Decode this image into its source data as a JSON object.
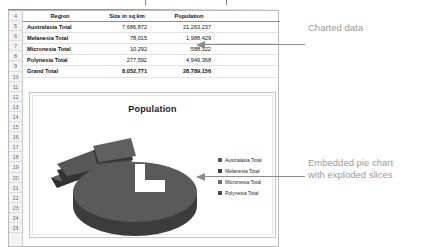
{
  "application": "spreadsheet",
  "worksheet": {
    "row_numbers": [
      4,
      5,
      6,
      7,
      8,
      9,
      10,
      11,
      12,
      13,
      14,
      15,
      16,
      17,
      18,
      19,
      20,
      21,
      22,
      23,
      24,
      25
    ],
    "table": {
      "headers": [
        "Region",
        "Size in sq km",
        "Population"
      ],
      "rows": [
        {
          "region": "Australasia Total",
          "size": "7,686,872",
          "population": "21,263,237"
        },
        {
          "region": "Melanesia Total",
          "size": "78,015",
          "population": "1,988,429"
        },
        {
          "region": "Micronesia Total",
          "size": "10,292",
          "population": "588,122"
        },
        {
          "region": "Polynesia Total",
          "size": "277,592",
          "population": "4,949,368"
        },
        {
          "region": "Grand Total",
          "size": "8,052,771",
          "population": "28,789,156"
        }
      ]
    }
  },
  "chart": {
    "title": "Population",
    "legend": [
      "Australasia Total",
      "Melanesia Total",
      "Micronesia Total",
      "Polynesia Total"
    ]
  },
  "chart_data": {
    "type": "pie",
    "title": "Population",
    "subtitle": "",
    "xlabel": "",
    "ylabel": "",
    "legend_position": "right",
    "exploded": true,
    "three_d": true,
    "categories": [
      "Australasia Total",
      "Melanesia Total",
      "Micronesia Total",
      "Polynesia Total"
    ],
    "values": [
      21263237,
      1988429,
      588122,
      4949368
    ],
    "percentages": [
      73.9,
      6.9,
      2.0,
      17.2
    ],
    "colors": [
      "#595959",
      "#3f3f3f",
      "#6e6e6e",
      "#4a4a4a"
    ]
  },
  "annotations": {
    "charted_data": "Charted data",
    "pie_chart_line1": "Embedded pie chart",
    "pie_chart_line2": "with exploded slices"
  },
  "colors": {
    "grid_line": "#dcdcdc",
    "gutter_background": "#f3f3f3",
    "annotation_text": "#9a9a9a",
    "leader_line": "#8c8c8c",
    "chart_border": "#c4c4c4"
  }
}
